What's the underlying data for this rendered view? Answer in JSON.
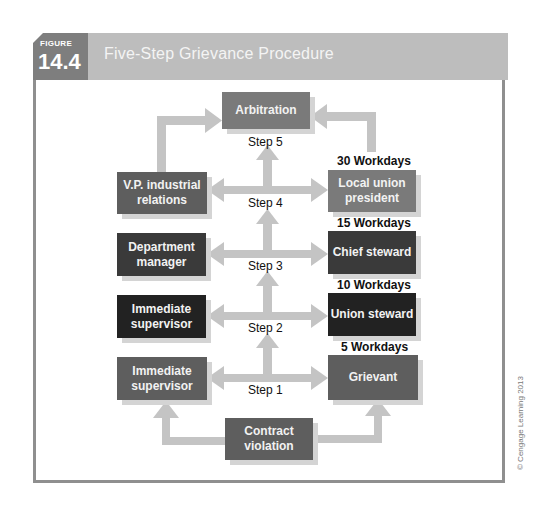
{
  "figure": {
    "label": "FIGURE",
    "number": "14.4",
    "title": "Five-Step Grievance Procedure"
  },
  "boxes": {
    "arbitration": "Arbitration",
    "vp": "V.P. industrial relations",
    "local_union": "Local union president",
    "dept_manager": "Department manager",
    "chief_steward": "Chief steward",
    "supervisor_2": "Immediate supervisor",
    "union_steward": "Union steward",
    "supervisor_1": "Immediate supervisor",
    "grievant": "Grievant",
    "contract": "Contract violation"
  },
  "steps": {
    "s1": "Step 1",
    "s2": "Step 2",
    "s3": "Step 3",
    "s4": "Step 4",
    "s5": "Step 5"
  },
  "workdays": {
    "w30": "30 Workdays",
    "w15": "15 Workdays",
    "w10": "10 Workdays",
    "w5": "5 Workdays"
  },
  "colors": {
    "arrow": "#c4c4c4",
    "box_light": "#7a7a7a",
    "box_mid": "#5e5e5e",
    "box_dark": "#3a3a3a",
    "box_darkest": "#222222",
    "header": "#bdbdbd"
  },
  "copyright": "© Cengage Learning 2013"
}
